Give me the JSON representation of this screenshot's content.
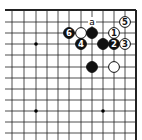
{
  "diagram": {
    "type": "go-board-fragment",
    "line_color": "#222222",
    "edges": [
      "top",
      "right"
    ],
    "star_points": [
      {
        "col": 2,
        "row": 3
      },
      {
        "col": 2,
        "row": 9
      },
      {
        "col": 8,
        "row": 9
      }
    ],
    "stones": [
      {
        "color": "black",
        "col": 5,
        "row": 2,
        "label": "6"
      },
      {
        "color": "white",
        "col": 6,
        "row": 2,
        "label": ""
      },
      {
        "color": "black",
        "col": 7,
        "row": 2,
        "label": ""
      },
      {
        "color": "black",
        "col": 6,
        "row": 3,
        "label": "4"
      },
      {
        "color": "black",
        "col": 8,
        "row": 3,
        "label": ""
      },
      {
        "color": "black",
        "col": 9,
        "row": 3,
        "label": "2"
      },
      {
        "color": "white",
        "col": 10,
        "row": 3,
        "label": "3"
      },
      {
        "color": "white",
        "col": 9,
        "row": 2,
        "label": "1"
      },
      {
        "color": "white",
        "col": 10,
        "row": 1,
        "label": "5"
      },
      {
        "color": "black",
        "col": 7,
        "row": 5,
        "label": ""
      },
      {
        "color": "white",
        "col": 9,
        "row": 5,
        "label": ""
      }
    ],
    "markers": [
      {
        "col": 7,
        "row": 1,
        "label": "a"
      }
    ]
  }
}
